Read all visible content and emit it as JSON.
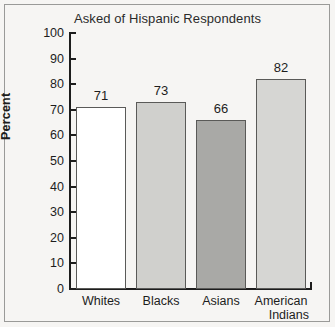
{
  "chart_data": {
    "type": "bar",
    "title": "Asked of Hispanic Respondents",
    "xlabel": "",
    "ylabel": "Percent",
    "ylim": [
      0,
      100
    ],
    "yticks": [
      0,
      10,
      20,
      30,
      40,
      50,
      60,
      70,
      80,
      90,
      100
    ],
    "ytick_labels": [
      "0",
      "10",
      "20",
      "30",
      "40",
      "50",
      "60",
      "70",
      "80",
      "90",
      "100"
    ],
    "grid": false,
    "legend": "none",
    "categories": [
      "Whites",
      "Blacks",
      "Asians",
      "American Indians"
    ],
    "category_lines": [
      [
        "Whites"
      ],
      [
        "Blacks"
      ],
      [
        "Asians"
      ],
      [
        "American",
        "Indians"
      ]
    ],
    "values": [
      71,
      73,
      66,
      82
    ],
    "value_labels": [
      "71",
      "73",
      "66",
      "82"
    ],
    "bar_colors": [
      "#ffffff",
      "#d0d0cd",
      "#a9a9a6",
      "#d6d6d3"
    ],
    "bar_edge_color": "#5a5a58",
    "axis_color": "#1d1d1d",
    "background_color": "#f6f5f3",
    "frame_color": "#9a9a98"
  }
}
